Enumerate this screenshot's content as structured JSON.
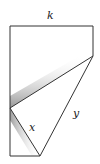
{
  "diagram": {
    "type": "folded-paper-geometry",
    "labels": {
      "top_edge": "k",
      "lower_left_segment": "x",
      "diagonal_segment": "y"
    },
    "colors": {
      "stroke": "#333333",
      "shadow": "#9a9a9a",
      "background": "#ffffff"
    }
  }
}
